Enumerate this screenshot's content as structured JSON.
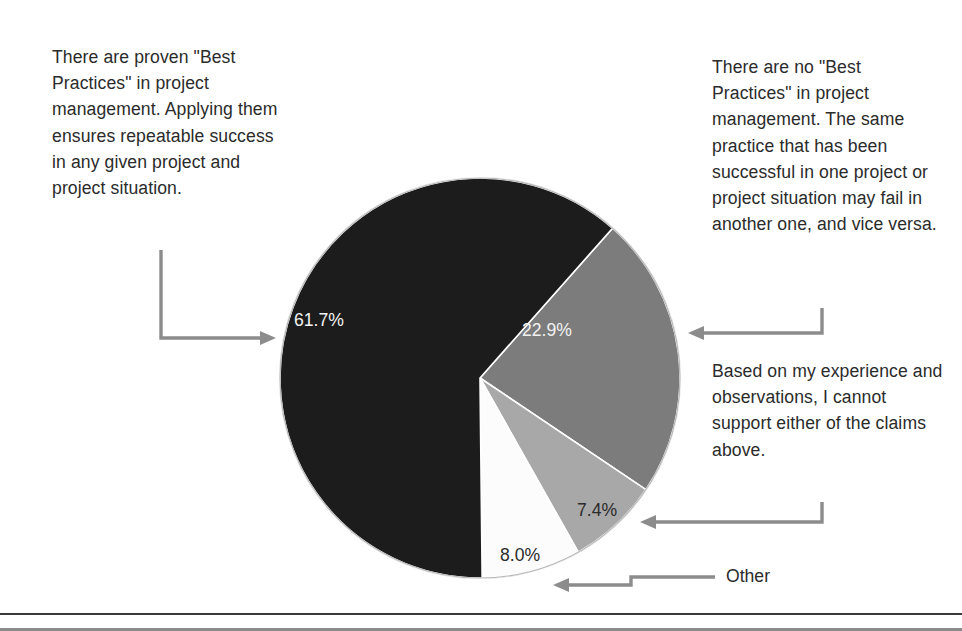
{
  "chart_data": {
    "type": "pie",
    "title": "",
    "legend_position": "callout-annotations",
    "start_angle_deg": 41.5,
    "direction": "clockwise",
    "categories": [
      "There are no \"Best Practices\" in project management. The same practice that has been successful in one project or project situation may fail in another one, and vice versa.",
      "Based on my experience and observations, I cannot support either of the claims above.",
      "Other",
      "There are proven \"Best Practices\" in project management. Applying them ensures repeatable success in any given project and project situation."
    ],
    "values": [
      22.9,
      7.4,
      8.0,
      61.7
    ],
    "labels": [
      "22.9%",
      "7.4%",
      "8.0%",
      "61.7%"
    ],
    "colors": [
      "#7b7b7b",
      "#a8a8a8",
      "#fcfcfc",
      "#1f1f1f"
    ],
    "label_colors": [
      "#f2f2f2",
      "#2b2b2b",
      "#2b2b2b",
      "#f2f2f2"
    ],
    "units": "percent"
  },
  "annotations": {
    "left": "There are proven \"Best Practices\" in project management. Applying them ensures repeatable success in any given project and project situation.",
    "right_top": "There are no \"Best Practices\" in project management. The same practice that has been successful in one project or project situation may fail in another one, and vice versa.",
    "right_bottom": "Based on my experience and observations, I cannot support either of the claims above.",
    "other": "Other"
  },
  "colors": {
    "slice_dark": "#1f1f1f",
    "slice_gray": "#7b7b7b",
    "slice_light_gray": "#a8a8a8",
    "slice_white": "#fcfcfc",
    "text": "#2b2b2b",
    "leader": "#8c8c8c",
    "rule": "#3a3a3a"
  }
}
